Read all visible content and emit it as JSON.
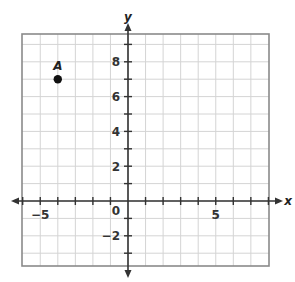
{
  "diagram": {
    "type": "coordinate-plane",
    "axes": {
      "x_label": "x",
      "y_label": "y",
      "x_range": [
        -6,
        8
      ],
      "y_range": [
        -3.8,
        9.6
      ],
      "grid_step": 1
    },
    "tick_labels": {
      "x": [
        {
          "value": -5,
          "text": "−5"
        },
        {
          "value": 5,
          "text": "5"
        }
      ],
      "y": [
        {
          "value": 8,
          "text": "8"
        },
        {
          "value": 6,
          "text": "6"
        },
        {
          "value": 4,
          "text": "4"
        },
        {
          "value": 2,
          "text": "2"
        },
        {
          "value": -2,
          "text": "−2"
        }
      ],
      "origin": "0"
    },
    "points": [
      {
        "label": "A",
        "x": -4,
        "y": 7
      }
    ],
    "colors": {
      "grid": "#d4d4d4",
      "border": "#8a8a8a",
      "axis": "#333333",
      "point": "#111111"
    }
  }
}
